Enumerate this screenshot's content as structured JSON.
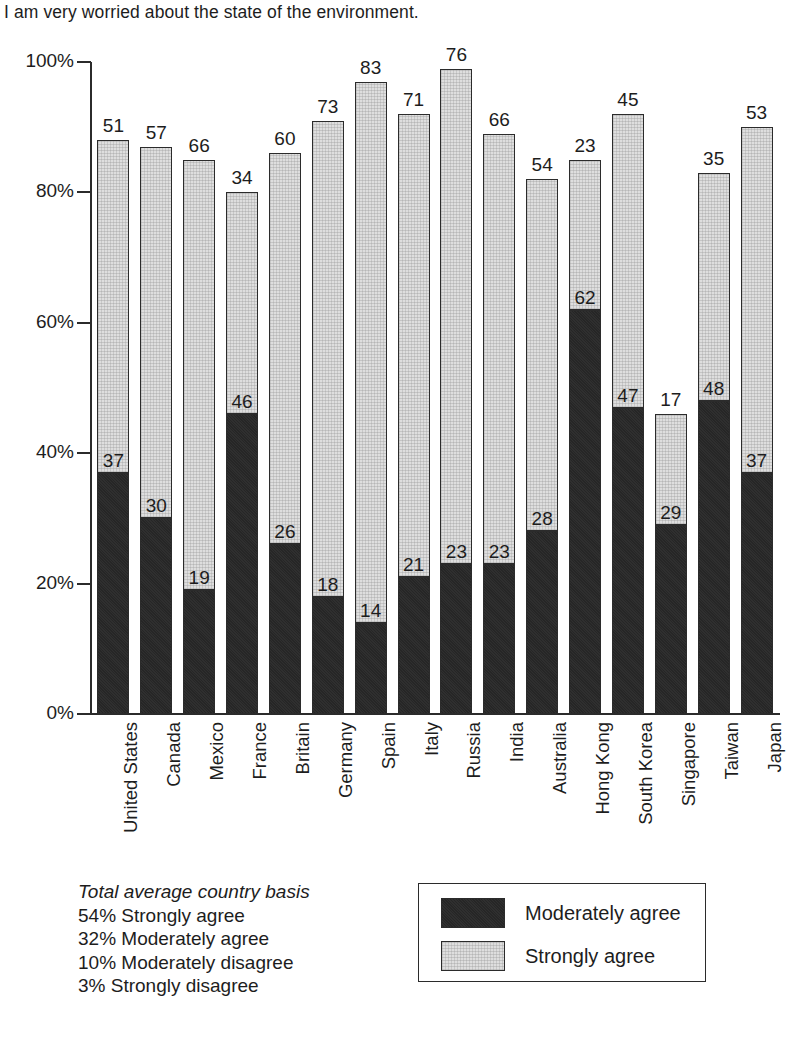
{
  "chart_data": {
    "type": "bar",
    "title": "I am very worried about the state of the environment.",
    "xlabel": "",
    "ylabel": "",
    "ylim": [
      0,
      100
    ],
    "grid": false,
    "stacked": true,
    "legend_position": "bottom-right",
    "ytick_labels": [
      "0%",
      "20%",
      "40%",
      "60%",
      "80%",
      "100%"
    ],
    "ytick_values": [
      0,
      20,
      40,
      60,
      80,
      100
    ],
    "categories": [
      "United States",
      "Canada",
      "Mexico",
      "France",
      "Britain",
      "Germany",
      "Spain",
      "Italy",
      "Russia",
      "India",
      "Australia",
      "Hong Kong",
      "South Korea",
      "Singapore",
      "Taiwan",
      "Japan"
    ],
    "series": [
      {
        "name": "Moderately agree",
        "color": "#262626",
        "values": [
          37,
          30,
          19,
          46,
          26,
          18,
          14,
          21,
          23,
          23,
          28,
          62,
          47,
          29,
          48,
          37
        ]
      },
      {
        "name": "Strongly agree",
        "color": "#dedede",
        "values": [
          51,
          57,
          66,
          34,
          60,
          73,
          83,
          71,
          76,
          66,
          54,
          23,
          45,
          17,
          35,
          53
        ]
      }
    ],
    "totals": [
      88,
      87,
      85,
      80,
      86,
      91,
      97,
      92,
      99,
      89,
      82,
      85,
      92,
      46,
      83,
      90
    ]
  },
  "footnote": {
    "heading": "Total average country basis",
    "lines": [
      "54% Strongly agree",
      "32% Moderately agree",
      "10% Moderately disagree",
      "3% Strongly disagree"
    ]
  },
  "legend": {
    "items": [
      {
        "label": "Moderately agree",
        "swatch": "dark"
      },
      {
        "label": "Strongly agree",
        "swatch": "light"
      }
    ]
  }
}
